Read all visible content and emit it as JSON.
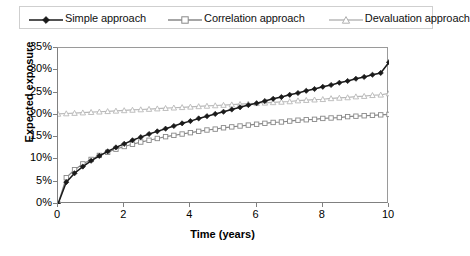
{
  "chart_data": {
    "type": "line",
    "title": "",
    "xlabel": "Time (years)",
    "ylabel": "Expected exposure",
    "xlim": [
      0,
      10
    ],
    "ylim": [
      0,
      0.35
    ],
    "xticks": [
      "0",
      "2",
      "4",
      "6",
      "8",
      "10"
    ],
    "xtick_values": [
      0,
      2,
      4,
      6,
      8,
      10
    ],
    "yticks": [
      "0%",
      "5%",
      "10%",
      "15%",
      "20%",
      "25%",
      "30%",
      "35%"
    ],
    "ytick_values": [
      0,
      5,
      10,
      15,
      20,
      25,
      30,
      35
    ],
    "grid": false,
    "legend_position": "top",
    "x": [
      0,
      0.25,
      0.5,
      0.75,
      1,
      1.25,
      1.5,
      1.75,
      2,
      2.25,
      2.5,
      2.75,
      3,
      3.25,
      3.5,
      3.75,
      4,
      4.25,
      4.5,
      4.75,
      5,
      5.25,
      5.5,
      5.75,
      6,
      6.25,
      6.5,
      6.75,
      7,
      7.25,
      7.5,
      7.75,
      8,
      8.25,
      8.5,
      8.75,
      9,
      9.25,
      9.5,
      9.75,
      10
    ],
    "series": [
      {
        "name": "Simple approach",
        "color": "#1a1a1a",
        "marker": "diamond-filled",
        "values": [
          0.0,
          4.9,
          6.9,
          8.4,
          9.7,
          10.8,
          11.8,
          12.7,
          13.5,
          14.3,
          15.0,
          15.7,
          16.3,
          16.9,
          17.5,
          18.1,
          18.6,
          19.2,
          19.7,
          20.2,
          20.7,
          21.2,
          21.7,
          22.2,
          22.6,
          23.1,
          23.6,
          24.0,
          24.5,
          24.9,
          25.4,
          25.8,
          26.3,
          26.7,
          27.2,
          27.6,
          28.1,
          28.5,
          29.0,
          29.4,
          31.8
        ]
      },
      {
        "name": "Correlation approach",
        "color": "#888888",
        "marker": "square-open",
        "values": [
          0.0,
          5.9,
          7.7,
          9.0,
          10.0,
          10.9,
          11.6,
          12.3,
          12.9,
          13.4,
          13.9,
          14.3,
          14.7,
          15.1,
          15.4,
          15.7,
          16.0,
          16.3,
          16.6,
          16.8,
          17.1,
          17.3,
          17.5,
          17.7,
          17.9,
          18.1,
          18.3,
          18.4,
          18.6,
          18.8,
          18.9,
          19.0,
          19.2,
          19.3,
          19.4,
          19.6,
          19.7,
          19.8,
          19.9,
          20.0,
          20.1
        ]
      },
      {
        "name": "Devaluation approach",
        "color": "#b8b8b8",
        "marker": "triangle-open",
        "values": [
          20.2,
          20.3,
          20.4,
          20.5,
          20.6,
          20.7,
          20.8,
          20.9,
          21.0,
          21.1,
          21.2,
          21.3,
          21.4,
          21.5,
          21.6,
          21.7,
          21.8,
          21.9,
          22.0,
          22.1,
          22.2,
          22.3,
          22.4,
          22.5,
          22.6,
          22.7,
          22.8,
          22.9,
          23.0,
          23.2,
          23.3,
          23.4,
          23.5,
          23.7,
          23.8,
          23.9,
          24.1,
          24.2,
          24.4,
          24.5,
          24.8
        ]
      }
    ]
  },
  "legend": {
    "items": [
      {
        "label": "Simple approach"
      },
      {
        "label": "Correlation approach"
      },
      {
        "label": "Devaluation approach"
      }
    ]
  },
  "axes": {
    "x_title": "Time (years)",
    "y_title": "Expected exposure"
  }
}
